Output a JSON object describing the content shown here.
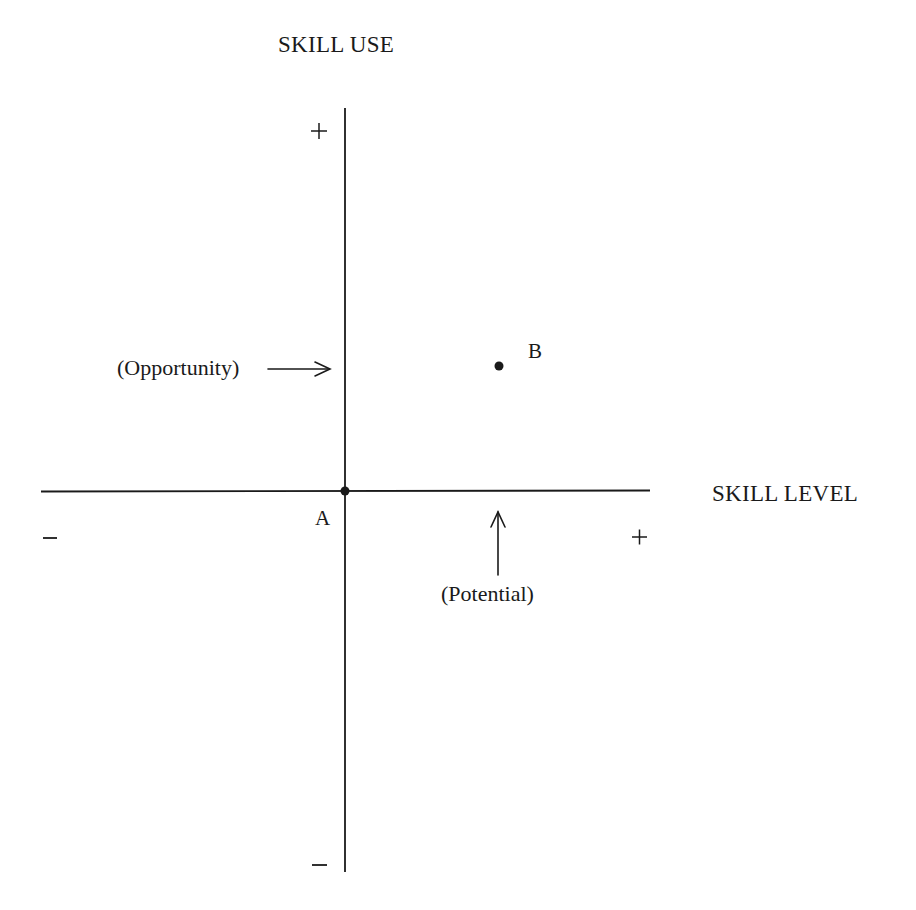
{
  "diagram": {
    "type": "quadrant-axes",
    "y_axis": {
      "title": "SKILL USE",
      "positive_label": "+",
      "negative_label": "−"
    },
    "x_axis": {
      "title": "SKILL LEVEL",
      "positive_label": "+",
      "negative_label": "−"
    },
    "points": [
      {
        "id": "A",
        "label": "A",
        "position": "origin"
      },
      {
        "id": "B",
        "label": "B",
        "position": "upper-right quadrant"
      }
    ],
    "annotations": [
      {
        "id": "opportunity",
        "label": "(Opportunity)",
        "arrow": "right",
        "points_to": "vertical axis at height of B"
      },
      {
        "id": "potential",
        "label": "(Potential)",
        "arrow": "up",
        "points_to": "horizontal axis at position of B"
      }
    ],
    "colors": {
      "ink": "#1a1a1a",
      "background": "#ffffff"
    }
  }
}
